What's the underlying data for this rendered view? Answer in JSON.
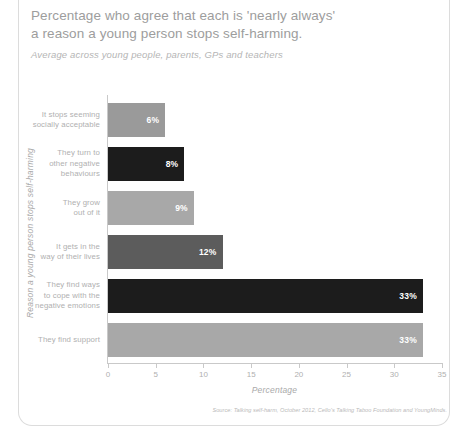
{
  "card": {
    "title_lines": [
      "Percentage who agree that each is 'nearly always'",
      "a reason a young person stops self-harming."
    ],
    "subtitle": "Average across young people, parents, GPs and teachers",
    "source": "Source: Talking self-harm, October 2012, Cello's Talking Taboo Foundation and YoungMinds."
  },
  "chart_data": {
    "type": "bar",
    "orientation": "horizontal",
    "title": "Percentage who agree that each is 'nearly always' a reason a young person stops self-harming.",
    "subtitle": "Average across young people, parents, GPs and teachers",
    "xlabel": "Percentage",
    "ylabel": "Reason a young person stops self-harming",
    "xlim": [
      0,
      35
    ],
    "xticks": [
      0,
      5,
      10,
      15,
      20,
      25,
      30,
      35
    ],
    "xtick_labels": [
      "0",
      "5",
      "10",
      "15",
      "20",
      "25",
      "30",
      "35"
    ],
    "grid": false,
    "legend": "none",
    "categories": [
      "It stops seeming socially acceptable",
      "They turn to other negative behaviours",
      "They grow out of it",
      "It gets in the way of their lives",
      "They find ways to cope with the negative emotions",
      "They find support"
    ],
    "values": [
      6,
      8,
      9,
      12,
      33,
      33
    ],
    "value_labels": [
      "6%",
      "8%",
      "9%",
      "12%",
      "33%",
      "33%"
    ],
    "bar_colors": [
      "#9a9a9a",
      "#1c1c1c",
      "#a8a8a8",
      "#5c5c5c",
      "#1c1c1c",
      "#a8a8a8"
    ],
    "category_lines": [
      [
        "It stops seeming",
        "socially acceptable"
      ],
      [
        "They turn to",
        "other negative",
        "behaviours"
      ],
      [
        "They grow",
        "out of it"
      ],
      [
        "It gets in the",
        "way of their lives"
      ],
      [
        "They find ways",
        "to cope with the",
        "negative emotions"
      ],
      [
        "They find support"
      ]
    ]
  },
  "colors": {
    "title_text": "#9d9d9d",
    "muted_text": "#b0b0b0",
    "axis": "#c9c9c9",
    "border": "#dcdcdc",
    "dark_bar": "#1c1c1c",
    "light_bar": "#a8a8a8",
    "mid_bar": "#5c5c5c"
  }
}
